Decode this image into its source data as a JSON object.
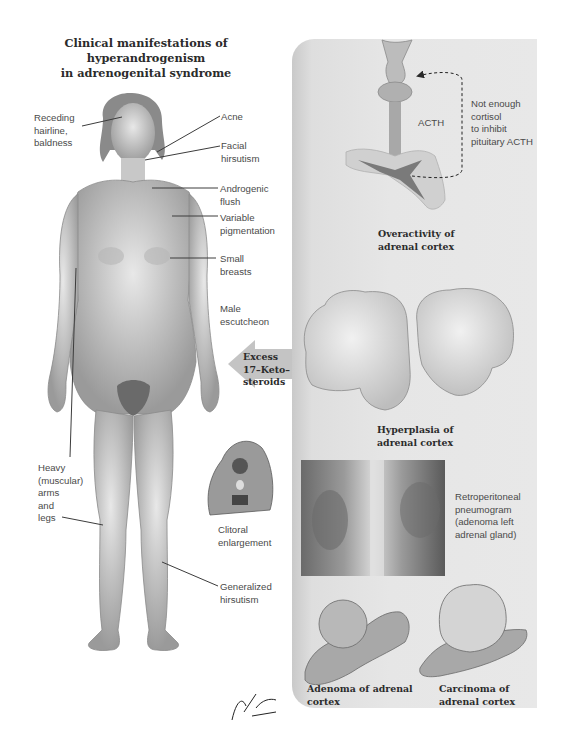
{
  "title": "Clinical manifestations of hyperandrogenism\nin adrenogenital syndrome",
  "title_lines": [
    "Clinical manifestations of hyperandrogenism",
    "in adrenogenital syndrome"
  ],
  "figure_labels": {
    "receding_hairline": "Receding\nhairline,\nbaldness",
    "acne": "Acne",
    "facial_hirsutism": "Facial\nhirsutism",
    "androgenic_flush": "Androgenic\nflush",
    "variable_pigmentation": "Variable\npigmentation",
    "small_breasts": "Small\nbreasts",
    "male_escutcheon": "Male\nescutcheon",
    "heavy_arms_legs": "Heavy\n(muscular)\narms\nand\nlegs",
    "clitoral_enlargement": "Clitoral\nenlargement",
    "generalized_hirsutism": "Generalized\nhirsutism"
  },
  "arrow": {
    "label": "Excess\n17–Keto–\nsteroids"
  },
  "panel": {
    "acth_label": "ACTH",
    "feedback_label": "Not enough\ncortisol\nto inhibit\npituitary ACTH",
    "overactivity_caption": "Overactivity of\nadrenal cortex",
    "hyperplasia_caption": "Hyperplasia of\nadrenal cortex",
    "pneumogram_caption": "Retroperitoneal\npneumogram\n(adenoma left\nadrenal gland)",
    "adenoma_caption": "Adenoma of adrenal\ncortex",
    "carcinoma_caption": "Carcinoma of\nadrenal cortex"
  },
  "signature": "F. Netter M.D.",
  "colors": {
    "panel_bg": "#e6e6e6",
    "acth_arrow": "#a8a8a8",
    "keto_arrow": "#c4c4c4",
    "text": "#4a4a4a"
  }
}
